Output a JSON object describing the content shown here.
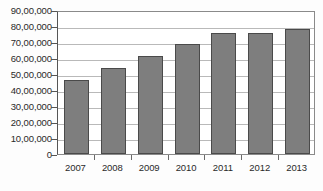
{
  "chart_data": {
    "type": "bar",
    "title": "",
    "subtitle": "",
    "xlabel": "",
    "ylabel": "",
    "categories": [
      "2007",
      "2008",
      "2009",
      "2010",
      "2011",
      "2012",
      "2013"
    ],
    "values": [
      4600000,
      5400000,
      6100000,
      6850000,
      7550000,
      7550000,
      7800000
    ],
    "value_labels": [
      "46,00,000",
      "54,00,000",
      "61,00,000",
      "68,50,000",
      "75,50,000",
      "75,50,000",
      "78,00,000"
    ],
    "series": [
      {
        "name": "",
        "values": [
          4600000,
          5400000,
          6100000,
          6850000,
          7550000,
          7550000,
          7800000
        ]
      }
    ],
    "ylim": [
      0,
      9000000
    ],
    "ytick_values": [
      9000000,
      8000000,
      7000000,
      6000000,
      5000000,
      4000000,
      3000000,
      2000000,
      1000000,
      0
    ],
    "ytick_labels": [
      "90,00,000",
      "80,00,000",
      "70,00,000",
      "60,00,000",
      "50,00,000",
      "40,00,000",
      "30,00,000",
      "20,00,000",
      "10,00,000",
      "0"
    ],
    "grid": true,
    "grid_axis": "y",
    "legend": false,
    "legend_position": "none",
    "annotations": [],
    "colors": {
      "bar_fill": "#7e7e7e",
      "bar_border": "#4a4a4a",
      "gridline": "#b9b9b9",
      "axis": "#555555",
      "plot_border": "#8a8a8a",
      "text": "#2a2a2a",
      "background": "#fdfdfd"
    }
  }
}
